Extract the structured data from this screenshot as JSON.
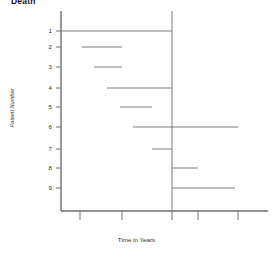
{
  "chart_data": {
    "type": "line",
    "title": "Death",
    "xlabel": "Time in Years",
    "ylabel": "Patient Number",
    "grid": false,
    "legend": null,
    "xlim": [
      0,
      5.25
    ],
    "ylim": [
      0.5,
      9.5
    ],
    "x_tick_labels": [
      "",
      "",
      "",
      "",
      ""
    ],
    "x_tick_values": [
      0.5,
      1.5,
      2.5,
      3.5,
      4.5
    ],
    "y_tick_labels": [
      "1",
      "2",
      "3",
      "4",
      "5",
      "6",
      "7",
      "8",
      "9"
    ],
    "y_tick_values": [
      1,
      2,
      3,
      4,
      5,
      6,
      7,
      8,
      9
    ],
    "reference_line": {
      "x": 2.5,
      "orientation": "vertical"
    },
    "series": [
      {
        "name": "Patient 1",
        "y": 1,
        "x_start": 0.0,
        "x_end": 2.45
      },
      {
        "name": "Patient 2",
        "y": 2,
        "x_start": 0.52,
        "x_end": 1.5
      },
      {
        "name": "Patient 3",
        "y": 3,
        "x_start": 0.82,
        "x_end": 1.5
      },
      {
        "name": "Patient 4",
        "y": 4,
        "x_start": 1.15,
        "x_end": 2.75
      },
      {
        "name": "Patient 5",
        "y": 5,
        "x_start": 1.48,
        "x_end": 2.28
      },
      {
        "name": "Patient 6",
        "y": 6,
        "x_start": 1.8,
        "x_end": 4.4
      },
      {
        "name": "Patient 7",
        "y": 7,
        "x_start": 2.28,
        "x_end": 2.78
      },
      {
        "name": "Patient 8",
        "y": 8,
        "x_start": 2.78,
        "x_end": 3.42
      },
      {
        "name": "Patient 9",
        "y": 9,
        "x_start": 2.78,
        "x_end": 4.35
      }
    ]
  },
  "axes": {
    "axis_color": "#6e6e6e",
    "line_color": "#7a7a7a",
    "text_color": "#2b2b2b"
  },
  "geometry": {
    "plot_left": 61,
    "plot_right": 268,
    "plot_top": 11,
    "plot_bottom": 211,
    "row_y": [
      31,
      47,
      67,
      88,
      107,
      127,
      149,
      168,
      188
    ],
    "x_tick_px": [
      80,
      122,
      172,
      198,
      238
    ],
    "ref_line_px": 172,
    "segments_px": [
      {
        "x1": 61,
        "x2": 172
      },
      {
        "x1": 82,
        "x2": 122
      },
      {
        "x1": 94,
        "x2": 122
      },
      {
        "x1": 107,
        "x2": 172
      },
      {
        "x1": 120,
        "x2": 152
      },
      {
        "x1": 133,
        "x2": 238
      },
      {
        "x1": 152,
        "x2": 172
      },
      {
        "x1": 172,
        "x2": 198
      },
      {
        "x1": 172,
        "x2": 235
      }
    ]
  }
}
